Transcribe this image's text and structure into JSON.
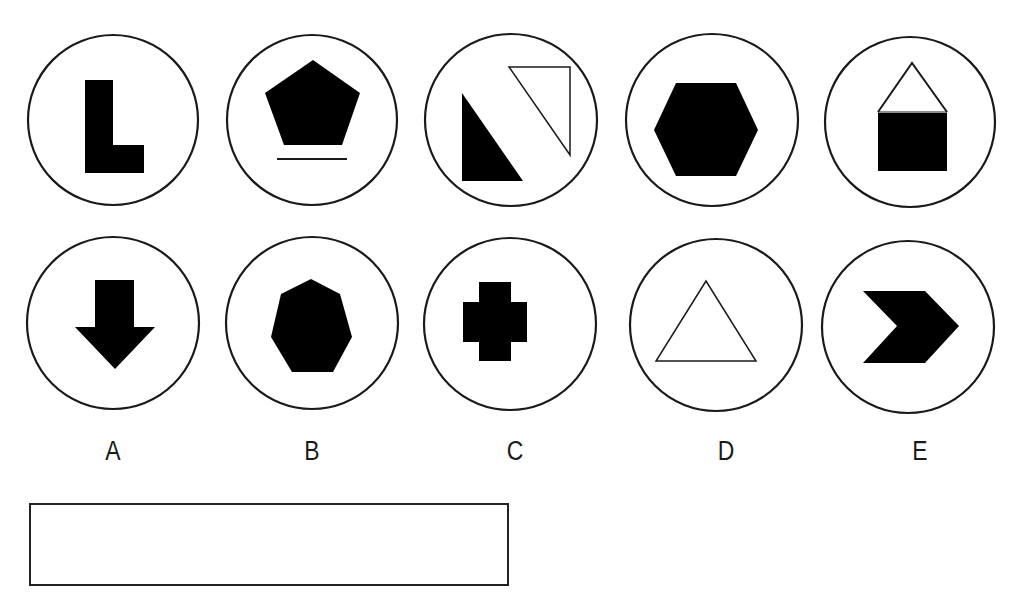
{
  "puzzle": {
    "type": "odd-one-out figure set",
    "instruction_visible": false,
    "stroke_color": "#1a1a1a",
    "fill_color": "#000000",
    "background_color": "#ffffff"
  },
  "options": [
    {
      "label": "A",
      "top_figure": {
        "shape": "L-shape",
        "style": "filled"
      },
      "bottom_figure": {
        "shape": "down-arrow",
        "style": "filled"
      }
    },
    {
      "label": "B",
      "top_figure": {
        "shape": "pentagon-with-underline",
        "style": "filled"
      },
      "bottom_figure": {
        "shape": "heptagon",
        "style": "filled"
      }
    },
    {
      "label": "C",
      "top_figure": {
        "shape": "two-right-triangles",
        "style": "one filled, one outlined"
      },
      "bottom_figure": {
        "shape": "cross",
        "style": "filled"
      }
    },
    {
      "label": "D",
      "top_figure": {
        "shape": "hexagon",
        "style": "filled"
      },
      "bottom_figure": {
        "shape": "triangle",
        "style": "outlined"
      }
    },
    {
      "label": "E",
      "top_figure": {
        "shape": "house (triangle on square)",
        "style": "outlined triangle, filled square"
      },
      "bottom_figure": {
        "shape": "chevron",
        "style": "filled"
      }
    }
  ],
  "answer_box": {
    "value": ""
  }
}
